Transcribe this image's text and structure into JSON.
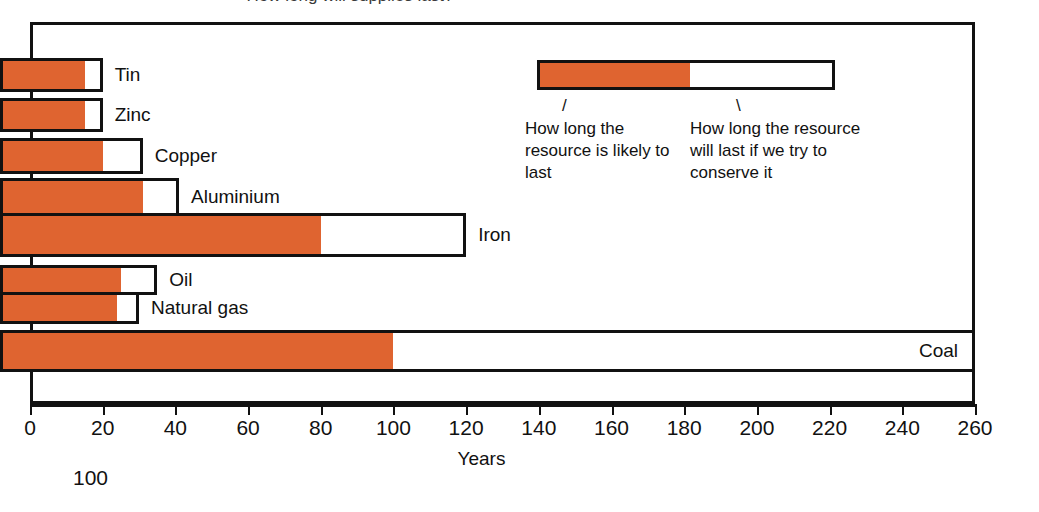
{
  "figure": {
    "clipped_title": "How long will supplies last?",
    "page_number": "100"
  },
  "legend": {
    "leader_left_glyph": "/",
    "leader_right_glyph": "\\",
    "caption_left": "How long the resource is likely to last",
    "caption_right": "How long the resource will last if we try to conserve it",
    "fill_color": "#DF6430",
    "outline_color": "#111111"
  },
  "chart_data": {
    "type": "bar",
    "orientation": "horizontal",
    "title": "How long will supplies last?",
    "xlabel": "Years",
    "ylabel": "",
    "xlim": [
      0,
      260
    ],
    "xticks": [
      0,
      20,
      40,
      60,
      80,
      100,
      120,
      140,
      160,
      180,
      200,
      220,
      240,
      260
    ],
    "xtick_labels": [
      "0",
      "20",
      "40",
      "60",
      "80",
      "100",
      "120",
      "140",
      "160",
      "180",
      "200",
      "220",
      "240",
      "260"
    ],
    "grid": false,
    "legend_position": "inside-top-right",
    "stacked": true,
    "categories": [
      "Tin",
      "Zinc",
      "Copper",
      "Aluminium",
      "Iron",
      "Oil",
      "Natural gas",
      "Coal"
    ],
    "series": [
      {
        "name": "How long the resource is likely to last",
        "color": "#DF6430",
        "values": [
          15,
          15,
          20,
          31,
          80,
          25,
          24,
          100
        ]
      },
      {
        "name": "How long the resource will last if we try to conserve it",
        "color": "#FFFFFF",
        "values": [
          20,
          20,
          31,
          41,
          120,
          35,
          30,
          260
        ]
      }
    ],
    "bars": [
      {
        "label": "Tin",
        "likely": 15,
        "conserved": 20,
        "label_position": "outside"
      },
      {
        "label": "Zinc",
        "likely": 15,
        "conserved": 20,
        "label_position": "outside"
      },
      {
        "label": "Copper",
        "likely": 20,
        "conserved": 31,
        "label_position": "outside"
      },
      {
        "label": "Aluminium",
        "likely": 31,
        "conserved": 41,
        "label_position": "outside"
      },
      {
        "label": "Iron",
        "likely": 80,
        "conserved": 120,
        "label_position": "outside"
      },
      {
        "label": "Oil",
        "likely": 25,
        "conserved": 35,
        "label_position": "outside"
      },
      {
        "label": "Natural gas",
        "likely": 24,
        "conserved": 30,
        "label_position": "outside"
      },
      {
        "label": "Coal",
        "likely": 100,
        "conserved": 260,
        "label_position": "inside"
      }
    ]
  }
}
